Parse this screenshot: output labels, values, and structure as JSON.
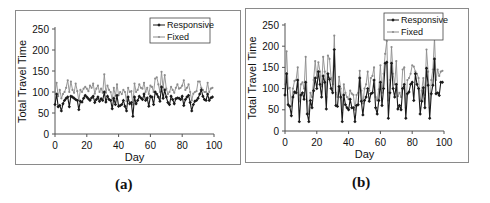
{
  "captions": {
    "a": "(a)",
    "b": "(b)"
  },
  "chart_data": [
    {
      "id": "a",
      "type": "line",
      "title": "",
      "xlabel": "Day",
      "ylabel": "Total Travel Time",
      "xlim": [
        0,
        100
      ],
      "ylim": [
        0,
        250
      ],
      "xticks": [
        0,
        20,
        40,
        60,
        80,
        100
      ],
      "yticks": [
        0,
        50,
        100,
        150,
        200,
        250
      ],
      "grid": false,
      "legend_position": "top-right",
      "x": [
        0,
        1,
        2,
        3,
        4,
        5,
        6,
        7,
        8,
        9,
        10,
        11,
        12,
        13,
        14,
        15,
        16,
        17,
        18,
        19,
        20,
        21,
        22,
        23,
        24,
        25,
        26,
        27,
        28,
        29,
        30,
        31,
        32,
        33,
        34,
        35,
        36,
        37,
        38,
        39,
        40,
        41,
        42,
        43,
        44,
        45,
        46,
        47,
        48,
        49,
        50,
        51,
        52,
        53,
        54,
        55,
        56,
        57,
        58,
        59,
        60,
        61,
        62,
        63,
        64,
        65,
        66,
        67,
        68,
        69,
        70,
        71,
        72,
        73,
        74,
        75,
        76,
        77,
        78,
        79,
        80,
        81,
        82,
        83,
        84,
        85,
        86,
        87,
        88,
        89,
        90,
        91,
        92,
        93,
        94,
        95,
        96,
        97,
        98,
        99
      ],
      "series": [
        {
          "name": "Responsive",
          "color": "#1a1a1a",
          "marker": "diamond",
          "values": [
            70,
            95,
            65,
            68,
            55,
            72,
            80,
            85,
            88,
            65,
            90,
            88,
            85,
            82,
            80,
            58,
            78,
            76,
            85,
            92,
            88,
            84,
            80,
            86,
            90,
            75,
            82,
            88,
            78,
            84,
            80,
            100,
            76,
            90,
            82,
            80,
            60,
            85,
            70,
            92,
            66,
            68,
            70,
            80,
            66,
            55,
            88,
            72,
            75,
            42,
            88,
            72,
            80,
            90,
            86,
            82,
            95,
            80,
            86,
            66,
            90,
            88,
            70,
            100,
            95,
            88,
            78,
            112,
            85,
            105,
            88,
            75,
            70,
            90,
            82,
            72,
            84,
            86,
            85,
            82,
            90,
            68,
            82,
            88,
            92,
            75,
            55,
            70,
            78,
            80,
            85,
            95,
            105,
            90,
            82,
            80,
            95,
            80,
            86,
            88
          ]
        },
        {
          "name": "Fixed",
          "color": "#8c8c8c",
          "marker": "dot",
          "values": [
            100,
            122,
            90,
            105,
            85,
            95,
            100,
            110,
            128,
            100,
            125,
            105,
            98,
            120,
            102,
            80,
            105,
            100,
            108,
            112,
            108,
            102,
            115,
            110,
            120,
            96,
            108,
            115,
            100,
            108,
            98,
            142,
            98,
            115,
            105,
            100,
            82,
            110,
            90,
            118,
            92,
            100,
            95,
            105,
            100,
            78,
            110,
            100,
            102,
            70,
            120,
            100,
            105,
            118,
            110,
            108,
            122,
            100,
            110,
            95,
            115,
            112,
            100,
            132,
            135,
            118,
            100,
            148,
            110,
            140,
            108,
            95,
            100,
            112,
            105,
            98,
            110,
            118,
            108,
            110,
            115,
            128,
            105,
            110,
            118,
            100,
            80,
            96,
            100,
            102,
            125,
            125,
            110,
            105,
            100,
            100,
            122,
            100,
            108,
            110
          ]
        }
      ]
    },
    {
      "id": "b",
      "type": "line",
      "title": "",
      "xlabel": "Day",
      "ylabel": "Total Travel Time",
      "xlim": [
        0,
        100
      ],
      "ylim": [
        0,
        250
      ],
      "xticks": [
        0,
        20,
        40,
        60,
        80,
        100
      ],
      "yticks": [
        0,
        50,
        100,
        150,
        200,
        250
      ],
      "grid": false,
      "legend_position": "top-right",
      "x": [
        0,
        1,
        2,
        3,
        4,
        5,
        6,
        7,
        8,
        9,
        10,
        11,
        12,
        13,
        14,
        15,
        16,
        17,
        18,
        19,
        20,
        21,
        22,
        23,
        24,
        25,
        26,
        27,
        28,
        29,
        30,
        31,
        32,
        33,
        34,
        35,
        36,
        37,
        38,
        39,
        40,
        41,
        42,
        43,
        44,
        45,
        46,
        47,
        48,
        49,
        50,
        51,
        52,
        53,
        54,
        55,
        56,
        57,
        58,
        59,
        60,
        61,
        62,
        63,
        64,
        65,
        66,
        67,
        68,
        69,
        70,
        71,
        72,
        73,
        74,
        75,
        76,
        77,
        78,
        79,
        80,
        81,
        82,
        83,
        84,
        85,
        86,
        87,
        88,
        89,
        90,
        91,
        92,
        93,
        94,
        95,
        96,
        97,
        98,
        99
      ],
      "series": [
        {
          "name": "Responsive",
          "color": "#1a1a1a",
          "marker": "diamond",
          "values": [
            85,
            135,
            62,
            58,
            36,
            80,
            92,
            90,
            120,
            22,
            85,
            90,
            75,
            115,
            40,
            22,
            72,
            55,
            95,
            125,
            100,
            140,
            110,
            80,
            130,
            115,
            52,
            135,
            122,
            100,
            90,
            192,
            60,
            58,
            105,
            80,
            22,
            85,
            62,
            55,
            50,
            75,
            55,
            55,
            22,
            60,
            62,
            125,
            70,
            38,
            72,
            80,
            100,
            70,
            88,
            90,
            120,
            55,
            40,
            72,
            115,
            60,
            100,
            160,
            162,
            30,
            90,
            160,
            100,
            80,
            110,
            52,
            60,
            50,
            100,
            110,
            30,
            88,
            92,
            110,
            115,
            72,
            135,
            110,
            100,
            40,
            70,
            102,
            55,
            148,
            108,
            30,
            88,
            108,
            170,
            88,
            90,
            84,
            115,
            115
          ]
        },
        {
          "name": "Fixed",
          "color": "#8c8c8c",
          "marker": "dot",
          "values": [
            110,
            188,
            100,
            102,
            60,
            100,
            118,
            120,
            150,
            70,
            110,
            115,
            100,
            175,
            70,
            40,
            90,
            80,
            120,
            165,
            125,
            162,
            140,
            105,
            175,
            140,
            80,
            178,
            170,
            125,
            110,
            225,
            90,
            80,
            128,
            100,
            50,
            110,
            90,
            80,
            75,
            95,
            88,
            85,
            50,
            85,
            90,
            142,
            95,
            65,
            100,
            110,
            140,
            95,
            125,
            130,
            150,
            80,
            72,
            98,
            155,
            90,
            135,
            182,
            212,
            72,
            120,
            198,
            135,
            110,
            165,
            82,
            90,
            80,
            145,
            150,
            55,
            120,
            125,
            135,
            155,
            152,
            140,
            135,
            125,
            72,
            95,
            125,
            85,
            192,
            140,
            55,
            120,
            145,
            220,
            120,
            145,
            130,
            140,
            142
          ]
        }
      ]
    }
  ]
}
